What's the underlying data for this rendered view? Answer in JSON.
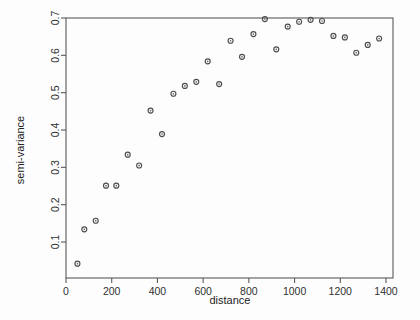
{
  "figure": {
    "type": "scatter-plot",
    "background_color": "#fdfdfd",
    "point_color": "#4d4d4d",
    "axis_color": "#5a5a5a"
  },
  "axes": {
    "x_title": "distance",
    "y_title": "semi-variance",
    "x_ticks": [
      "0",
      "200",
      "400",
      "600",
      "800",
      "1000",
      "1200",
      "1400"
    ],
    "y_ticks": [
      "0.1",
      "0.2",
      "0.3",
      "0.4",
      "0.5",
      "0.6",
      "0.7"
    ]
  },
  "chart_data": {
    "type": "scatter",
    "title": "",
    "xlabel": "distance",
    "ylabel": "semi-variance",
    "xlim": [
      0,
      1400
    ],
    "ylim": [
      0.02,
      0.72
    ],
    "xticks": [
      0,
      200,
      400,
      600,
      800,
      1000,
      1200,
      1400
    ],
    "yticks": [
      0.1,
      0.2,
      0.3,
      0.4,
      0.5,
      0.6,
      0.7
    ],
    "grid": false,
    "legend": false,
    "marker": "open-circle",
    "series": [
      {
        "name": "semi-variance",
        "x": [
          50,
          80,
          130,
          175,
          220,
          270,
          320,
          370,
          420,
          470,
          520,
          570,
          620,
          670,
          720,
          770,
          820,
          870,
          920,
          970,
          1020,
          1070,
          1120,
          1170,
          1220,
          1270,
          1320,
          1370
        ],
        "y": [
          0.042,
          0.134,
          0.157,
          0.251,
          0.251,
          0.334,
          0.305,
          0.452,
          0.389,
          0.497,
          0.518,
          0.529,
          0.584,
          0.523,
          0.639,
          0.596,
          0.657,
          0.697,
          0.616,
          0.677,
          0.69,
          0.695,
          0.692,
          0.652,
          0.648,
          0.607,
          0.628,
          0.645
        ]
      }
    ]
  }
}
